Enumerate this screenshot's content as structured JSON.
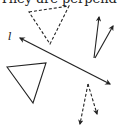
{
  "caption": "They are perpendicu",
  "line_label": "l",
  "shapes": {
    "dashed_triangle": {
      "points": "29,12 69,6 50,44",
      "style": "dashed"
    },
    "solid_triangle": {
      "points": "7,67 46,63 33,103",
      "style": "solid"
    },
    "line_l": {
      "from": [
        20,
        38
      ],
      "to": [
        110,
        84
      ],
      "arrows": "both"
    },
    "solid_arrows_top_right": [
      {
        "from": [
          94,
          58
        ],
        "to": [
          99,
          16
        ]
      },
      {
        "from": [
          96,
          58
        ],
        "to": [
          114,
          25
        ]
      }
    ],
    "dashed_arrows_bottom": [
      {
        "from": [
          88,
          84
        ],
        "to": [
          80,
          126
        ]
      },
      {
        "from": [
          88,
          84
        ],
        "to": [
          97,
          115
        ]
      }
    ]
  },
  "colors": {
    "stroke": "#222222",
    "background": "#ffffff"
  }
}
